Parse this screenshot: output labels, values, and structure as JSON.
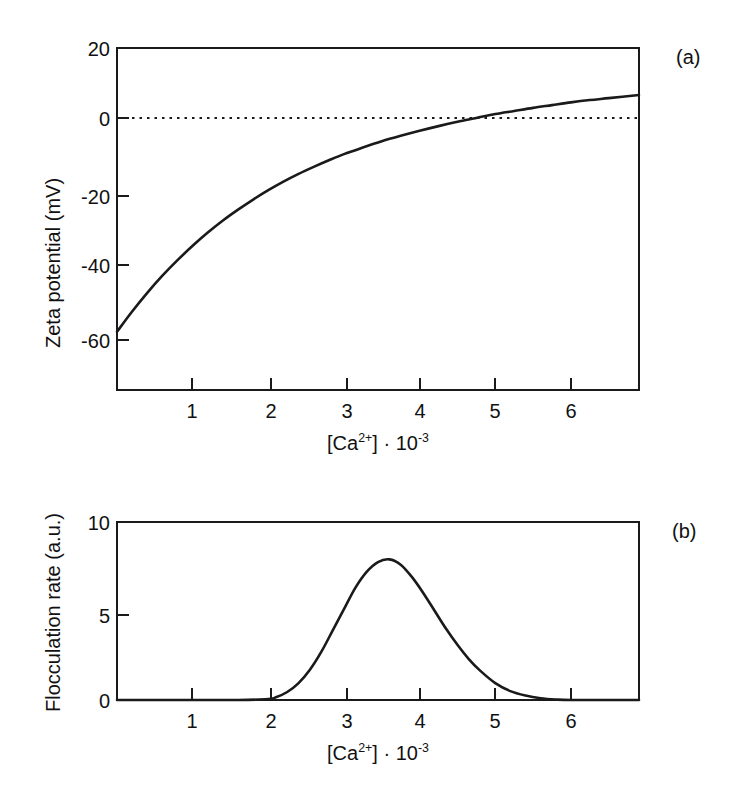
{
  "figure": {
    "panels": [
      {
        "tag": "(a)",
        "ylabel": "Zeta potential (mV)",
        "xlabel_parts": {
          "bracket_open": "[Ca",
          "charge": "2+",
          "bracket_close": "] · 10",
          "exponent": "-3"
        },
        "xlabel_plain": "[Ca2+] · 10-3"
      },
      {
        "tag": "(b)",
        "ylabel": "Flocculation rate (a.u.)",
        "xlabel_parts": {
          "bracket_open": "[Ca",
          "charge": "2+",
          "bracket_close": "] · 10",
          "exponent": "-3"
        },
        "xlabel_plain": "[Ca2+] · 10-3"
      }
    ]
  },
  "chart_data": [
    {
      "type": "line",
      "panel": "(a)",
      "title": "",
      "xlabel": "[Ca2+] · 10-3",
      "ylabel": "Zeta potential (mV)",
      "xlim": [
        0,
        6.9
      ],
      "ylim": [
        -68,
        20
      ],
      "xticks": [
        1,
        2,
        3,
        4,
        5,
        6
      ],
      "xticklabels": [
        "1",
        "2",
        "3",
        "4",
        "5",
        "6"
      ],
      "yticks": [
        20,
        0,
        -20,
        -40,
        -60
      ],
      "yticklabels": [
        "20",
        "0",
        "-20",
        "-40",
        "-60"
      ],
      "grid": false,
      "legend": null,
      "annotations": [
        {
          "text": "zero reference line",
          "type": "dotted-horizontal",
          "y": 0
        },
        {
          "text": "isoelectric point (curve crosses 0 mV)",
          "x": 3.25,
          "y": 0
        }
      ],
      "series": [
        {
          "name": "Zeta potential",
          "x": [
            0.0,
            0.2,
            0.4,
            0.6,
            0.8,
            1.0,
            1.2,
            1.4,
            1.6,
            1.8,
            2.0,
            2.2,
            2.4,
            2.6,
            2.8,
            3.0,
            3.25,
            3.5,
            3.75,
            4.0,
            4.25,
            4.5,
            4.75,
            5.0,
            5.25,
            5.5,
            5.75,
            6.0,
            6.25,
            6.5,
            6.9
          ],
          "y": [
            -53.0,
            -47.8,
            -43.0,
            -38.6,
            -34.6,
            -30.9,
            -27.5,
            -24.4,
            -21.6,
            -19.0,
            -16.6,
            -14.4,
            -12.4,
            -10.6,
            -8.9,
            -7.3,
            -5.6,
            -4.0,
            -2.6,
            -1.3,
            -0.1,
            1.0,
            2.0,
            3.0,
            3.8,
            4.6,
            5.3,
            6.0,
            6.6,
            7.1,
            7.9
          ]
        }
      ]
    },
    {
      "type": "line",
      "panel": "(b)",
      "title": "",
      "xlabel": "[Ca2+] · 10-3",
      "ylabel": "Flocculation rate (a.u.)",
      "xlim": [
        0,
        6.9
      ],
      "ylim": [
        0,
        10
      ],
      "xticks": [
        1,
        2,
        3,
        4,
        5,
        6
      ],
      "xticklabels": [
        "1",
        "2",
        "3",
        "4",
        "5",
        "6"
      ],
      "yticks": [
        10,
        5,
        0
      ],
      "yticklabels": [
        "10",
        "5",
        "0"
      ],
      "grid": false,
      "legend": null,
      "annotations": [
        {
          "text": "peak flocculation rate",
          "x": 3.6,
          "y": 7.9
        }
      ],
      "series": [
        {
          "name": "Flocculation rate",
          "x": [
            0.0,
            1.0,
            1.6,
            2.0,
            2.1,
            2.25,
            2.4,
            2.55,
            2.7,
            2.85,
            3.0,
            3.15,
            3.3,
            3.45,
            3.6,
            3.75,
            3.9,
            4.05,
            4.2,
            4.35,
            4.5,
            4.65,
            4.8,
            5.0,
            5.2,
            5.4,
            5.6,
            5.8,
            6.0,
            6.5,
            6.9
          ],
          "y": [
            0.0,
            0.0,
            0.0,
            0.05,
            0.15,
            0.45,
            0.95,
            1.7,
            2.7,
            3.9,
            5.1,
            6.3,
            7.2,
            7.75,
            7.9,
            7.6,
            6.9,
            6.0,
            5.0,
            4.0,
            3.1,
            2.3,
            1.65,
            0.95,
            0.5,
            0.25,
            0.1,
            0.03,
            0.0,
            0.0,
            0.0
          ]
        }
      ]
    }
  ]
}
